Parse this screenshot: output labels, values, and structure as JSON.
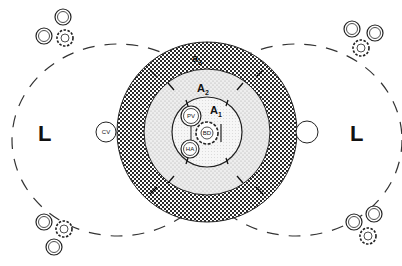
{
  "diagram": {
    "title": "",
    "colors": {
      "stroke": "#222222",
      "zone_a3_fill": "#4a4a4a",
      "zone_a2_fill": "#e6e6e6",
      "zone_a1_fill": "#f2f2f2",
      "background": "#ffffff"
    },
    "zones": [
      {
        "id": "a3",
        "label": "a",
        "sub": "3"
      },
      {
        "id": "a2",
        "label": "A",
        "sub": "2"
      },
      {
        "id": "a1",
        "label": "A",
        "sub": "1"
      }
    ],
    "structures": {
      "portal_vein": "PV",
      "hepatic_artery": "HA",
      "bile_duct": "BD",
      "central_vein": "CV"
    },
    "lobules": {
      "left": "L",
      "right": "L"
    }
  }
}
